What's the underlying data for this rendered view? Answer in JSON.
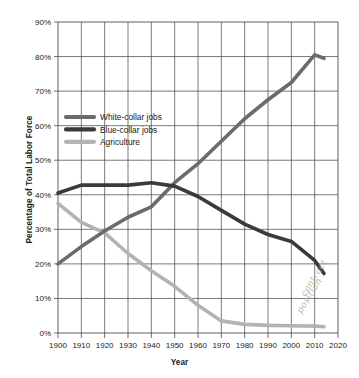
{
  "chart_data": {
    "type": "line",
    "title": "",
    "xlabel": "Year",
    "ylabel": "Percentage of Total Labor Force",
    "xlim": [
      1900,
      2020
    ],
    "ylim": [
      0,
      90
    ],
    "grid": true,
    "legend_position": "upper-left-inside",
    "x_ticks": [
      "1900",
      "1910",
      "1920",
      "1930",
      "1940",
      "1950",
      "1960",
      "1970",
      "1980",
      "1990",
      "2000",
      "2010",
      "2020"
    ],
    "y_ticks": [
      "0%",
      "10%",
      "20%",
      "30%",
      "40%",
      "50%",
      "60%",
      "70%",
      "80%",
      "90%"
    ],
    "x": [
      1900,
      1910,
      1920,
      1930,
      1940,
      1950,
      1960,
      1970,
      1980,
      1990,
      2000,
      2010,
      2014
    ],
    "series": [
      {
        "name": "White-collar jobs",
        "color": "#6b6b6b",
        "values": [
          20,
          25,
          29.5,
          33.5,
          36.5,
          43.5,
          49,
          55.5,
          62,
          67.5,
          72.5,
          80.5,
          79.5
        ]
      },
      {
        "name": "Blue-collar jobs",
        "color": "#3a3a3a",
        "values": [
          40.5,
          42.8,
          42.8,
          42.8,
          43.5,
          42.5,
          39.5,
          35.5,
          31.5,
          28.5,
          26.5,
          21,
          17.2
        ]
      },
      {
        "name": "Agriculture",
        "color": "#b3b3b3",
        "values": [
          37.5,
          32,
          29,
          23,
          18,
          13.5,
          8,
          3.5,
          2.5,
          2.2,
          2.1,
          2,
          1.8
        ]
      }
    ]
  },
  "annotations": {
    "handwritten_line_1": "contract",
    "handwritten_line_2": "position"
  },
  "legend": {
    "items": [
      {
        "label": "White-collar jobs",
        "swatch": "#6b6b6b"
      },
      {
        "label": "Blue-collar jobs",
        "swatch": "#3a3a3a"
      },
      {
        "label": "Agriculture",
        "swatch": "#b3b3b3"
      }
    ]
  }
}
